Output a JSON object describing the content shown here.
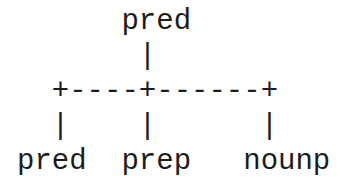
{
  "diagram": {
    "type": "ascii-tree",
    "root": "pred",
    "children": [
      "pred",
      "prep",
      "nounp"
    ],
    "lines": [
      "      pred",
      "       |",
      "  +----+------+",
      "  |    |      |",
      "pred  prep   nounp"
    ]
  }
}
